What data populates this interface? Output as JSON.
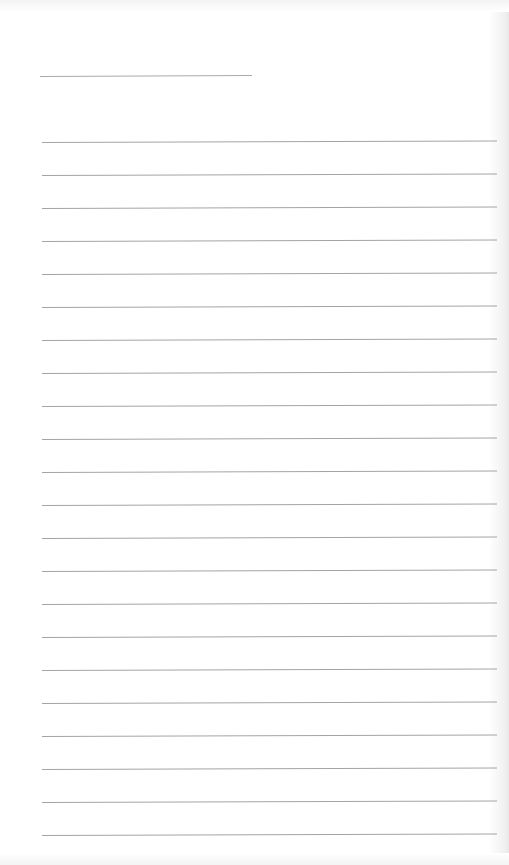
{
  "page": {
    "type": "lined-notebook-page",
    "background": "#ffffff",
    "line_color": "#a4a4a4"
  },
  "title_line": {
    "x": 40,
    "y": 76,
    "width": 212
  },
  "ruled_lines": {
    "count": 22,
    "first_y": 142,
    "spacing": 33,
    "x_start": 42,
    "x_end": 497
  }
}
